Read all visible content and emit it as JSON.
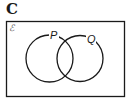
{
  "figure": {
    "label": "C",
    "universal_symbol": "ℰ",
    "sets": [
      {
        "name": "P",
        "cx": 49.5,
        "cy": 58.5,
        "r": 23.5
      },
      {
        "name": "Q",
        "cx": 80,
        "cy": 58.5,
        "r": 23
      }
    ]
  },
  "colors": {
    "stroke": "#1a1a1a",
    "background": "#ffffff"
  }
}
